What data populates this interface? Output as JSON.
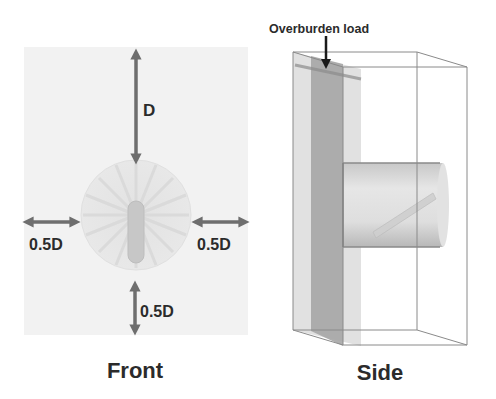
{
  "figure": {
    "front_panel": {
      "caption": "Front",
      "top_dimension_label": "D",
      "left_dimension_label": "0.5D",
      "right_dimension_label": "0.5D",
      "bottom_dimension_label": "0.5D"
    },
    "side_panel": {
      "caption": "Side",
      "load_annotation": "Overburden load"
    },
    "colors": {
      "background": "#ffffff",
      "front_soil": "#f1f1f1",
      "arrow": "#6e6e6e",
      "text": "#2b2b2b",
      "box_edges": "#8a8a8a",
      "dark_slab": "#9a9a9a",
      "light_slab": "#cfcfcf"
    }
  }
}
